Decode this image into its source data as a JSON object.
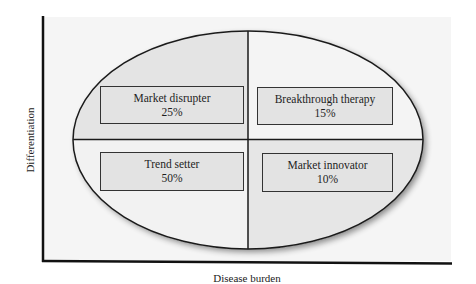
{
  "diagram": {
    "type": "quadrant-ellipse",
    "axes": {
      "x_label": "Disease burden",
      "y_label": "Differentiation"
    },
    "quadrants": [
      {
        "position": "top-left",
        "label": "Market disrupter",
        "value": "25%",
        "fill": "#e4e4e4"
      },
      {
        "position": "top-right",
        "label": "Breakthrough therapy",
        "value": "15%",
        "fill": "#f4f4f4"
      },
      {
        "position": "bottom-left",
        "label": "Trend setter",
        "value": "50%",
        "fill": "#f2f2f2"
      },
      {
        "position": "bottom-right",
        "label": "Market innovator",
        "value": "10%",
        "fill": "#e6e6e6"
      }
    ],
    "colors": {
      "plot_background": "#f5f5f5",
      "outline": "#1a1a1a",
      "box_fill": "#e3e3e3"
    }
  }
}
